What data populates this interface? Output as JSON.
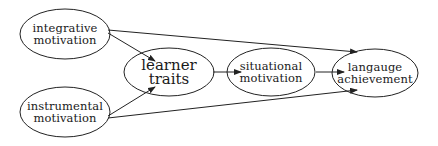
{
  "diagram": {
    "type": "path-diagram",
    "nodes": [
      {
        "id": "integrative",
        "lines": [
          "integrative",
          "motivation"
        ],
        "cx": 65,
        "cy": 34,
        "rx": 45,
        "ry": 25,
        "size": "small"
      },
      {
        "id": "instrumental",
        "lines": [
          "instrumental",
          "motivation"
        ],
        "cx": 65,
        "cy": 112,
        "rx": 45,
        "ry": 25,
        "size": "small"
      },
      {
        "id": "learner",
        "lines": [
          "learner",
          "traits"
        ],
        "cx": 169,
        "cy": 72,
        "rx": 45,
        "ry": 24,
        "size": "large"
      },
      {
        "id": "situational",
        "lines": [
          "situational",
          "motivation"
        ],
        "cx": 271,
        "cy": 72,
        "rx": 44,
        "ry": 24,
        "size": "small"
      },
      {
        "id": "achievement",
        "lines": [
          "langauge",
          "achievement"
        ],
        "cx": 375,
        "cy": 73,
        "rx": 43,
        "ry": 24,
        "size": "small"
      }
    ],
    "edges": [
      {
        "from": "integrative",
        "to": "learner",
        "x1": 108,
        "y1": 33,
        "x2": 155,
        "y2": 61
      },
      {
        "from": "instrumental",
        "to": "learner",
        "x1": 108,
        "y1": 116,
        "x2": 155,
        "y2": 87
      },
      {
        "from": "integrative",
        "to": "achievement",
        "x1": 108,
        "y1": 30,
        "x2": 357,
        "y2": 52
      },
      {
        "from": "instrumental",
        "to": "achievement",
        "x1": 108,
        "y1": 118,
        "x2": 357,
        "y2": 90
      },
      {
        "from": "learner",
        "to": "situational",
        "x1": 213,
        "y1": 72,
        "x2": 241,
        "y2": 72
      },
      {
        "from": "situational",
        "to": "achievement",
        "x1": 316,
        "y1": 72,
        "x2": 344,
        "y2": 72
      }
    ],
    "colors": {
      "stroke": "#222222",
      "text": "#1a1a1a",
      "background": "#ffffff"
    }
  }
}
